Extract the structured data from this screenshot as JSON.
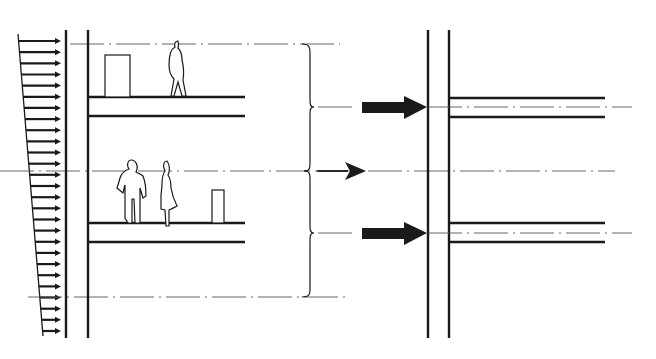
{
  "diagram": {
    "title": "Wind load on building facade transferred to floor slabs",
    "description": "Section showing a trapezoidal wind pressure distribution acting on a facade wall with two floor slabs; the load between slab centerlines is gathered by braces into a resultant point load and transferred as concentrated loads to each floor slab in the simplified structural model.",
    "colors": {
      "line": "#1a1a1a",
      "centerline": "#555555",
      "background": "#ffffff"
    },
    "left_section": {
      "wind_load": {
        "type": "trapezoidal distributed load",
        "arrow_count": 27,
        "direction": "right"
      },
      "wall": {
        "x_outer": 66,
        "x_inner": 88
      },
      "floors": [
        {
          "name": "upper-floor",
          "top_y": 97,
          "bottom_y": 116
        },
        {
          "name": "lower-floor",
          "top_y": 223,
          "bottom_y": 242
        }
      ],
      "figures": [
        {
          "name": "door-upper",
          "kind": "door"
        },
        {
          "name": "walking-person-upper",
          "kind": "person"
        },
        {
          "name": "standing-man-lower",
          "kind": "person"
        },
        {
          "name": "standing-woman-lower",
          "kind": "person"
        },
        {
          "name": "door-lower",
          "kind": "door"
        }
      ]
    },
    "centerlines_y": [
      44,
      107,
      171,
      233,
      297
    ],
    "braces": [
      {
        "name": "upper-brace",
        "from_y": 44,
        "to_y": 171,
        "tip_y": 107
      },
      {
        "name": "lower-brace",
        "from_y": 171,
        "to_y": 297,
        "tip_y": 233
      }
    ],
    "arrows": [
      {
        "name": "resultant-arrow-upper",
        "kind": "thick",
        "y": 107
      },
      {
        "name": "wind-arrow-middle",
        "kind": "thin",
        "y": 171
      },
      {
        "name": "resultant-arrow-lower",
        "kind": "thick",
        "y": 233
      }
    ],
    "right_section": {
      "wall": {
        "x_outer": 428,
        "x_inner": 449
      },
      "floors": [
        {
          "name": "upper-floor",
          "top_y": 98,
          "bottom_y": 117
        },
        {
          "name": "lower-floor",
          "top_y": 223,
          "bottom_y": 242
        }
      ]
    }
  }
}
